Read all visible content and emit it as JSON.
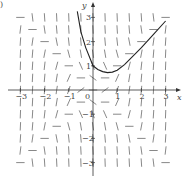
{
  "panel_label": ")",
  "chart_data": {
    "type": "line",
    "title": "",
    "xlabel": "x",
    "ylabel": "y",
    "xlim": [
      -3,
      3
    ],
    "ylim": [
      -3,
      3
    ],
    "grid": false,
    "x_ticks": [
      "-3",
      "-2",
      "-1",
      "0",
      "1",
      "2",
      "3"
    ],
    "y_ticks": [
      "3",
      "2",
      "1",
      "-1",
      "-2",
      "-3"
    ],
    "slope_field": {
      "x_range": [
        -3,
        3
      ],
      "y_range": [
        -3,
        3
      ],
      "step": 0.5
    },
    "series": [
      {
        "name": "solution curve",
        "x": [
          -0.65,
          -0.5,
          -0.3,
          -0.1,
          0.0,
          0.2,
          0.4,
          0.6,
          0.8,
          1.0,
          1.3,
          1.6,
          2.0,
          2.5,
          3.0
        ],
        "y": [
          3.25,
          2.4,
          1.75,
          1.25,
          1.0,
          0.85,
          0.76,
          0.72,
          0.74,
          0.82,
          1.05,
          1.35,
          1.75,
          2.3,
          2.85
        ]
      }
    ]
  }
}
